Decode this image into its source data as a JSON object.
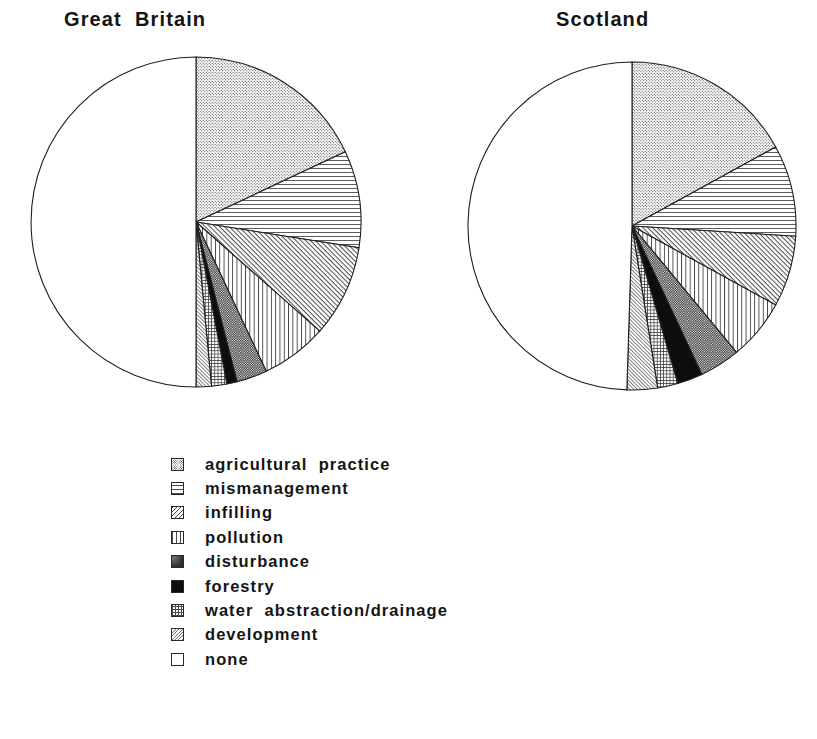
{
  "figure": {
    "background": "#ffffff",
    "outline_color": "#1f1f1f"
  },
  "titles": {
    "left": "Great  Britain",
    "right": "Scotland"
  },
  "legend": {
    "position": "below-charts",
    "items": [
      {
        "key": "agricultural_practice",
        "label": "agricultural  practice",
        "swatch": "fine-stipple-swatch",
        "swatch_class": "sw-agri"
      },
      {
        "key": "mismanagement",
        "label": "mismanagement",
        "swatch": "horizontal-lines-swatch",
        "swatch_class": "sw-mis"
      },
      {
        "key": "infilling",
        "label": "infilling",
        "swatch": "diagonal-hatch-swatch",
        "swatch_class": "sw-inf"
      },
      {
        "key": "pollution",
        "label": "pollution",
        "swatch": "vertical-lines-swatch",
        "swatch_class": "sw-pol"
      },
      {
        "key": "disturbance",
        "label": "disturbance",
        "swatch": "dark-stipple-swatch",
        "swatch_class": "sw-dis"
      },
      {
        "key": "forestry",
        "label": "forestry",
        "swatch": "solid-black-swatch",
        "swatch_class": "sw-for"
      },
      {
        "key": "water_abstraction_drainage",
        "label": "water  abstraction/drainage",
        "swatch": "cross-grid-swatch",
        "swatch_class": "sw-wat"
      },
      {
        "key": "development",
        "label": "development",
        "swatch": "light-diagonal-swatch",
        "swatch_class": "sw-dev"
      },
      {
        "key": "none",
        "label": "none",
        "swatch": "empty-white-swatch",
        "swatch_class": "sw-none"
      }
    ]
  },
  "chart_data": [
    {
      "type": "pie",
      "title": "Great  Britain",
      "start_angle_deg": 0,
      "direction": "clockwise",
      "center": [
        196,
        222
      ],
      "radius": 165,
      "labels": [
        "agricultural practice",
        "mismanagement",
        "infilling",
        "pollution",
        "disturbance",
        "forestry",
        "water abstraction/drainage",
        "development",
        "none"
      ],
      "values": [
        18.0,
        9.5,
        9.0,
        6.5,
        3.0,
        1.0,
        1.5,
        1.5,
        50.0
      ],
      "unit": "percent",
      "patterns": [
        "fine-stipple",
        "horizontal-lines",
        "diagonal-hatch",
        "vertical-lines",
        "dark-stipple",
        "solid-black",
        "cross-grid",
        "light-diagonal",
        "empty-white"
      ]
    },
    {
      "type": "pie",
      "title": "Scotland",
      "start_angle_deg": 0,
      "direction": "clockwise",
      "center": [
        632,
        226
      ],
      "radius": 164,
      "labels": [
        "agricultural practice",
        "mismanagement",
        "infilling",
        "pollution",
        "disturbance",
        "forestry",
        "water abstraction/drainage",
        "development",
        "none"
      ],
      "values": [
        17.0,
        9.0,
        7.0,
        6.0,
        4.0,
        2.5,
        2.0,
        3.0,
        49.5
      ],
      "unit": "percent",
      "patterns": [
        "fine-stipple",
        "horizontal-lines",
        "diagonal-hatch",
        "vertical-lines",
        "dark-stipple",
        "solid-black",
        "cross-grid",
        "light-diagonal",
        "empty-white"
      ]
    }
  ]
}
